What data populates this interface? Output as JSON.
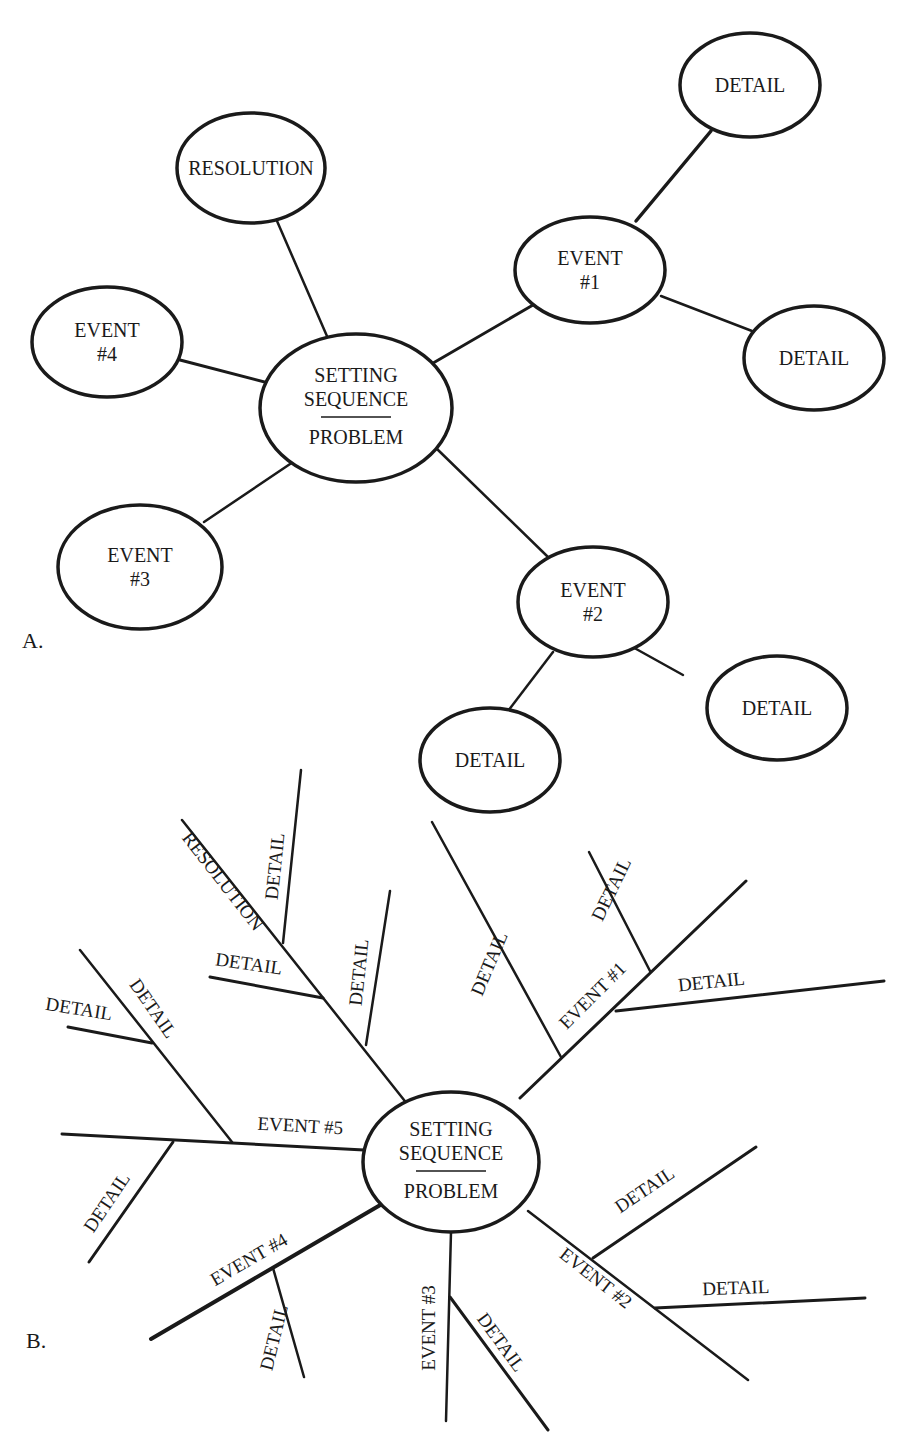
{
  "colors": {
    "ink": "#1a1a1a",
    "paper": "#ffffff"
  },
  "panel_a": {
    "label": "A.",
    "label_pos": [
      22,
      648
    ],
    "nodes": [
      {
        "id": "center",
        "lines": [
          "SETTING",
          "SEQUENCE",
          "PROBLEM"
        ],
        "divider": true,
        "cx": 356,
        "cy": 408,
        "rx": 96,
        "ry": 74
      },
      {
        "id": "resolution",
        "lines": [
          "RESOLUTION"
        ],
        "cx": 251,
        "cy": 168,
        "rx": 74,
        "ry": 55
      },
      {
        "id": "event1",
        "lines": [
          "EVENT",
          "#1"
        ],
        "cx": 590,
        "cy": 270,
        "rx": 75,
        "ry": 53
      },
      {
        "id": "event2",
        "lines": [
          "EVENT",
          "#2"
        ],
        "cx": 593,
        "cy": 602,
        "rx": 75,
        "ry": 55
      },
      {
        "id": "event3",
        "lines": [
          "EVENT",
          "#3"
        ],
        "cx": 140,
        "cy": 567,
        "rx": 82,
        "ry": 62
      },
      {
        "id": "event4",
        "lines": [
          "EVENT",
          "#4"
        ],
        "cx": 107,
        "cy": 342,
        "rx": 75,
        "ry": 55
      },
      {
        "id": "detail1a",
        "lines": [
          "DETAIL"
        ],
        "cx": 750,
        "cy": 85,
        "rx": 70,
        "ry": 52
      },
      {
        "id": "detail1b",
        "lines": [
          "DETAIL"
        ],
        "cx": 814,
        "cy": 358,
        "rx": 70,
        "ry": 52
      },
      {
        "id": "detail2a",
        "lines": [
          "DETAIL"
        ],
        "cx": 777,
        "cy": 708,
        "rx": 70,
        "ry": 52
      },
      {
        "id": "detail2b",
        "lines": [
          "DETAIL"
        ],
        "cx": 490,
        "cy": 760,
        "rx": 70,
        "ry": 52
      }
    ],
    "edges": [
      {
        "x1": 333,
        "y1": 350,
        "x2": 277,
        "y2": 221,
        "w": 2.5
      },
      {
        "x1": 428,
        "y1": 366,
        "x2": 533,
        "y2": 305,
        "w": 3
      },
      {
        "x1": 436,
        "y1": 448,
        "x2": 548,
        "y2": 557,
        "w": 2.5
      },
      {
        "x1": 280,
        "y1": 386,
        "x2": 180,
        "y2": 360,
        "w": 3
      },
      {
        "x1": 296,
        "y1": 460,
        "x2": 204,
        "y2": 522,
        "w": 2.5
      },
      {
        "x1": 636,
        "y1": 221,
        "x2": 711,
        "y2": 131,
        "w": 3.5
      },
      {
        "x1": 661,
        "y1": 296,
        "x2": 752,
        "y2": 331,
        "w": 2.5
      },
      {
        "x1": 629,
        "y1": 645,
        "x2": 683,
        "y2": 675,
        "w": 2.5
      },
      {
        "x1": 553,
        "y1": 652,
        "x2": 508,
        "y2": 711,
        "w": 2.5
      }
    ]
  },
  "panel_b": {
    "label": "B.",
    "label_pos": [
      26,
      1348
    ],
    "center": {
      "lines": [
        "SETTING",
        "SEQUENCE",
        "PROBLEM"
      ],
      "divider": true,
      "cx": 451,
      "cy": 1162,
      "rx": 88,
      "ry": 70
    },
    "lines": [
      {
        "id": "resolution-spine",
        "x1": 408,
        "y1": 1105,
        "x2": 182,
        "y2": 820,
        "w": 2.5
      },
      {
        "id": "resolution-detail-top",
        "x1": 283,
        "y1": 943,
        "x2": 301,
        "y2": 770,
        "w": 2.5
      },
      {
        "id": "resolution-detail-left",
        "x1": 323,
        "y1": 998,
        "x2": 210,
        "y2": 977,
        "w": 3
      },
      {
        "id": "resolution-detail-right",
        "x1": 366,
        "y1": 1045,
        "x2": 390,
        "y2": 891,
        "w": 2.5
      },
      {
        "id": "event5-spine",
        "x1": 364,
        "y1": 1150,
        "x2": 62,
        "y2": 1134,
        "w": 3
      },
      {
        "id": "event5-detail-upper",
        "x1": 232,
        "y1": 1142,
        "x2": 80,
        "y2": 950,
        "w": 2.5
      },
      {
        "id": "event5-detail-upper-sub",
        "x1": 152,
        "y1": 1043,
        "x2": 68,
        "y2": 1027,
        "w": 3
      },
      {
        "id": "event5-detail-lower",
        "x1": 173,
        "y1": 1142,
        "x2": 89,
        "y2": 1262,
        "w": 3
      },
      {
        "id": "event4-spine",
        "x1": 382,
        "y1": 1204,
        "x2": 151,
        "y2": 1339,
        "w": 4
      },
      {
        "id": "event4-detail",
        "x1": 273,
        "y1": 1268,
        "x2": 304,
        "y2": 1377,
        "w": 2.5
      },
      {
        "id": "event3-spine",
        "x1": 451,
        "y1": 1232,
        "x2": 446,
        "y2": 1421,
        "w": 2.5
      },
      {
        "id": "event3-detail",
        "x1": 450,
        "y1": 1297,
        "x2": 548,
        "y2": 1430,
        "w": 3
      },
      {
        "id": "event2-spine",
        "x1": 528,
        "y1": 1211,
        "x2": 748,
        "y2": 1380,
        "w": 2.5
      },
      {
        "id": "event2-detail-upper",
        "x1": 593,
        "y1": 1258,
        "x2": 756,
        "y2": 1147,
        "w": 3
      },
      {
        "id": "event2-detail-lower",
        "x1": 655,
        "y1": 1308,
        "x2": 865,
        "y2": 1298,
        "w": 3
      },
      {
        "id": "event1-spine",
        "x1": 520,
        "y1": 1098,
        "x2": 746,
        "y2": 881,
        "w": 3
      },
      {
        "id": "event1-detail-long",
        "x1": 561,
        "y1": 1057,
        "x2": 432,
        "y2": 822,
        "w": 2.5
      },
      {
        "id": "event1-detail-short",
        "x1": 650,
        "y1": 971,
        "x2": 589,
        "y2": 852,
        "w": 2.5
      },
      {
        "id": "event1-detail-right",
        "x1": 616,
        "y1": 1011,
        "x2": 884,
        "y2": 981,
        "w": 3
      }
    ],
    "labels": [
      {
        "text": "RESOLUTION",
        "x": 218,
        "y": 885,
        "rot": 52,
        "size": 19
      },
      {
        "text": "DETAIL",
        "x": 281,
        "y": 867,
        "rot": -84,
        "size": 19
      },
      {
        "text": "DETAIL",
        "x": 248,
        "y": 970,
        "rot": 8,
        "size": 19
      },
      {
        "text": "DETAIL",
        "x": 365,
        "y": 973,
        "rot": -84,
        "size": 19
      },
      {
        "text": "DETAIL",
        "x": 148,
        "y": 1012,
        "rot": 55,
        "size": 19
      },
      {
        "text": "DETAIL",
        "x": 78,
        "y": 1015,
        "rot": 9,
        "size": 19
      },
      {
        "text": "EVENT #5",
        "x": 300,
        "y": 1132,
        "rot": 3,
        "size": 19
      },
      {
        "text": "DETAIL",
        "x": 112,
        "y": 1206,
        "rot": -56,
        "size": 19
      },
      {
        "text": "EVENT #4",
        "x": 252,
        "y": 1265,
        "rot": -30,
        "size": 19
      },
      {
        "text": "DETAIL",
        "x": 280,
        "y": 1339,
        "rot": -76,
        "size": 19
      },
      {
        "text": "EVENT #3",
        "x": 435,
        "y": 1328,
        "rot": -90,
        "size": 19
      },
      {
        "text": "DETAIL",
        "x": 496,
        "y": 1346,
        "rot": 54,
        "size": 19
      },
      {
        "text": "EVENT #2",
        "x": 592,
        "y": 1283,
        "rot": 38,
        "size": 19
      },
      {
        "text": "DETAIL",
        "x": 648,
        "y": 1195,
        "rot": -34,
        "size": 19
      },
      {
        "text": "DETAIL",
        "x": 736,
        "y": 1294,
        "rot": -2,
        "size": 19
      },
      {
        "text": "EVENT #1",
        "x": 597,
        "y": 1000,
        "rot": -45,
        "size": 19
      },
      {
        "text": "DETAIL",
        "x": 495,
        "y": 966,
        "rot": -67,
        "size": 19
      },
      {
        "text": "DETAIL",
        "x": 617,
        "y": 892,
        "rot": -64,
        "size": 19
      },
      {
        "text": "DETAIL",
        "x": 712,
        "y": 988,
        "rot": -6,
        "size": 19
      }
    ]
  }
}
